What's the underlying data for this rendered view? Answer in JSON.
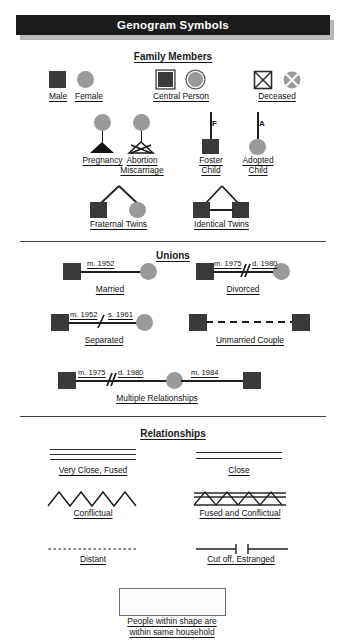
{
  "title": "Genogram Symbols",
  "sections": {
    "family": {
      "heading": "Family Members",
      "items": {
        "male": "Male",
        "female": "Female",
        "central": "Central Person",
        "deceased": "Deceased",
        "pregnancy": "Pregnancy",
        "abortion_line1": "Abortion",
        "abortion_line2": "Miscarriage",
        "foster_line1": "Foster",
        "foster_line2": "Child",
        "adopted_line1": "Adopted",
        "adopted_line2": "Child",
        "foster_mark": "F",
        "adopted_mark": "A",
        "fraternal_twins": "Fraternal Twins",
        "identical_twins": "Identical Twins"
      }
    },
    "unions": {
      "heading": "Unions",
      "items": {
        "married": "Married",
        "married_date": "m. 1952",
        "divorced": "Divorced",
        "divorced_date1": "m. 1975",
        "divorced_date2": "d. 1980",
        "separated": "Separated",
        "separated_date1": "m. 1952",
        "separated_date2": "s. 1961",
        "unmarried": "Unmarried Couple",
        "multiple": "Multiple Relationships",
        "multiple_date1": "m. 1975",
        "multiple_date2": "d. 1980",
        "multiple_date3": "m. 1984"
      }
    },
    "relationships": {
      "heading": "Relationships",
      "items": {
        "very_close": "Very Close, Fused",
        "close": "Close",
        "conflictual": "Conflictual",
        "fused_conflictual": "Fused and Conflictual",
        "distant": "Distant",
        "cutoff": "Cut off, Estranged",
        "household_line1": "People within shape are",
        "household_line2": "within same household"
      }
    }
  },
  "colors": {
    "title_bg": "#1c1c1c",
    "title_shadow": "#b9b9b9",
    "male_fill": "#3a3a3a",
    "female_fill": "#9a9a9a",
    "line": "#1f1f1f"
  }
}
